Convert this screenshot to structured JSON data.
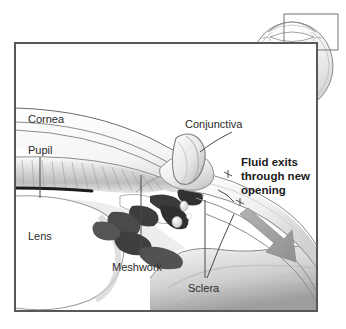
{
  "figure": {
    "frame": {
      "border_color": "#58585a",
      "background_color": "#ffffff"
    },
    "inset": {
      "name": "whole-eye-orientation-inset",
      "highlight_box_color": "#8a8a8a",
      "eye_outline_color": "#7d7d7d"
    }
  },
  "labels": [
    {
      "id": "cornea",
      "text": "Cornea",
      "bold": false
    },
    {
      "id": "pupil",
      "text": "Pupil",
      "bold": false
    },
    {
      "id": "lens",
      "text": "Lens",
      "bold": false
    },
    {
      "id": "meshwork",
      "text": "Meshwork",
      "bold": false
    },
    {
      "id": "sclera",
      "text": "Sclera",
      "bold": false
    },
    {
      "id": "conjunctiva",
      "text": "Conjunctiva",
      "bold": false
    }
  ],
  "callout": {
    "id": "fluid-exits-callout",
    "bold": true,
    "line1": "Fluid exits",
    "line2": "through new",
    "line3": "opening",
    "arrow_color": "#9a9a9a"
  },
  "colors": {
    "ink": "#2b2b2b",
    "line": "#8c8c8c",
    "frame": "#58585a",
    "tissue_light": "#f2f2f2",
    "tissue_mid": "#d4d4d4",
    "tissue_dark": "#6e6e6e",
    "fluid_dark": "#2f2f2f",
    "arrow": "#9a9a9a"
  }
}
